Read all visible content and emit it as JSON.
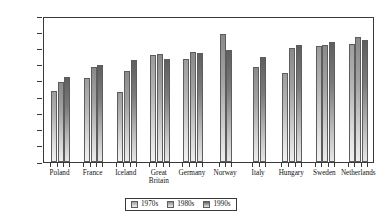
{
  "chart_data": {
    "type": "bar",
    "title": "",
    "xlabel": "",
    "ylabel": "Population production",
    "ylim": [
      0,
      45
    ],
    "ytick_step": 5,
    "yticks": [
      0,
      5,
      10,
      15,
      20,
      25,
      30,
      35,
      40,
      45
    ],
    "grid": false,
    "legend_position": "bottom-center",
    "categories": [
      "Poland",
      "France",
      "Iceland",
      "Great Britain",
      "Germany",
      "Norway",
      "Italy",
      "Hungary",
      "Sweden",
      "Netherlands"
    ],
    "series": [
      {
        "name": "1970s",
        "values": [
          22.0,
          26.0,
          21.6,
          32.9,
          31.9,
          null,
          null,
          27.3,
          35.9,
          36.4
        ]
      },
      {
        "name": "1980s",
        "values": [
          24.8,
          29.2,
          27.9,
          33.3,
          33.8,
          39.5,
          29.3,
          35.2,
          36.0,
          38.5
        ]
      },
      {
        "name": "1990s",
        "values": [
          26.3,
          30.0,
          31.4,
          31.8,
          33.6,
          34.6,
          32.5,
          36.0,
          36.9,
          37.7
        ]
      }
    ],
    "colors": {
      "series_1970s": "#b5b5b5",
      "series_1980s": "#a2a2a2",
      "series_1990s": "#7b7b7b",
      "axis": "#3a3a3a",
      "background": "#ffffff"
    }
  },
  "legend": {
    "entries": [
      {
        "label": "1970s"
      },
      {
        "label": "1980s"
      },
      {
        "label": "1990s"
      }
    ]
  }
}
